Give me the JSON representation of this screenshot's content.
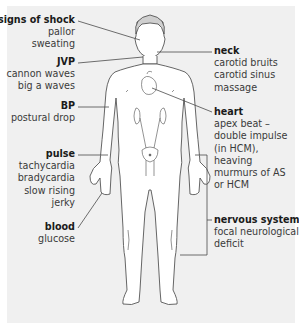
{
  "diagram": {
    "background_color": "#f0f0f0",
    "line_color": "#4a4a4a",
    "figure": "front-view-human-body",
    "labels": {
      "signs_of_shock": {
        "title": "signs of shock",
        "lines": [
          "pallor",
          "sweating"
        ]
      },
      "jvp": {
        "title": "JVP",
        "lines": [
          "cannon waves",
          "big a waves"
        ]
      },
      "bp": {
        "title": "BP",
        "lines": [
          "postural drop"
        ]
      },
      "pulse": {
        "title": "pulse",
        "lines": [
          "tachycardia",
          "bradycardia",
          "slow rising",
          "jerky"
        ]
      },
      "blood": {
        "title": "blood",
        "lines": [
          "glucose"
        ]
      },
      "neck": {
        "title": "neck",
        "lines": [
          "carotid bruits",
          "carotid sinus",
          "massage"
        ]
      },
      "heart": {
        "title": "heart",
        "lines": [
          "apex beat –",
          "double impulse",
          "(in HCM),",
          "heaving",
          "murmurs of AS",
          "or HCM"
        ]
      },
      "nervous_system": {
        "title": "nervous system",
        "lines": [
          "focal neurological",
          "deficit"
        ]
      }
    }
  }
}
